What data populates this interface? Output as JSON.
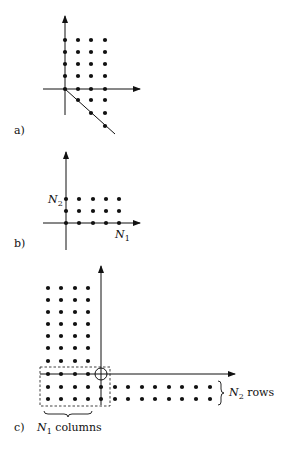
{
  "figure": {
    "panels": [
      {
        "id": "a",
        "label": "a)",
        "description": "Lattice of dots in first quadrant (5 rows x 4 columns above and on axis) plus triangular region below axis bounded by diagonal line"
      },
      {
        "id": "b",
        "label": "b)",
        "axis_label_vertical": {
          "main": "N",
          "sub": "2"
        },
        "axis_label_horizontal": {
          "main": "N",
          "sub": "1"
        },
        "grid": {
          "rows": 3,
          "columns": 5
        }
      },
      {
        "id": "c",
        "label": "c)",
        "upper_grid": {
          "rows": 8,
          "columns": 4
        },
        "lower_grid": {
          "rows": 2,
          "columns": 13
        },
        "brace_bottom_label": {
          "main": "N",
          "sub": "1",
          "text": " columns"
        },
        "brace_right_label": {
          "main": "N",
          "sub": "2",
          "text": " rows"
        }
      }
    ],
    "colors": {
      "ink": "#111111",
      "background": "#ffffff"
    }
  }
}
